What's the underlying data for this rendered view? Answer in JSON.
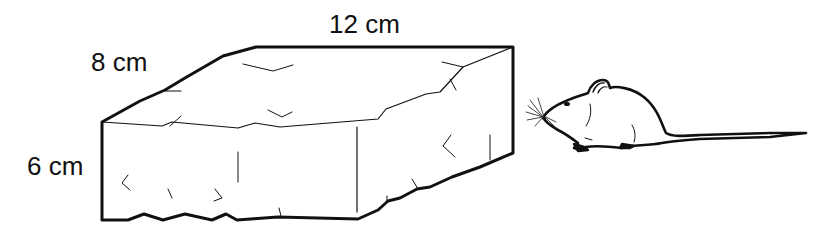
{
  "figure": {
    "labels": {
      "length": "12 cm",
      "width": "8 cm",
      "height": "6 cm"
    },
    "objects": [
      "rectangular-block",
      "mouse"
    ],
    "colors": {
      "stroke": "#111111",
      "background": "#ffffff"
    }
  }
}
